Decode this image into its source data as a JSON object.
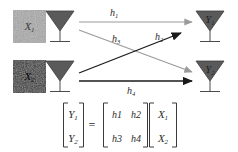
{
  "figure": {
    "colors": {
      "gray_arrow": "#9a9a9a",
      "black_arrow": "#1a1a1a",
      "antenna_fill": "#5a5a5a",
      "antenna_stroke": "#3c3c3c",
      "box_light": "#a8a8a8",
      "box_dark": "#2b2b2b",
      "text": "#2b2b2b",
      "background": "#ffffff"
    }
  },
  "transmitters": [
    {
      "id": "tx1",
      "source_box_label": "X",
      "source_box_sub": "1",
      "box_shade": "light",
      "antenna_name": "tx1-antenna"
    },
    {
      "id": "tx2",
      "source_box_label": "X",
      "source_box_sub": "2",
      "box_shade": "dark",
      "antenna_name": "tx2-antenna"
    }
  ],
  "receivers": [
    {
      "id": "rx1",
      "antenna_label": "Y",
      "antenna_sub": "1"
    },
    {
      "id": "rx2",
      "antenna_label": "Y",
      "antenna_sub": "2"
    }
  ],
  "channels": [
    {
      "id": "h1",
      "label": "h",
      "sub": "1",
      "from": "tx1",
      "to": "rx1",
      "style": "gray",
      "path": "horizontal-top"
    },
    {
      "id": "h3",
      "label": "h",
      "sub": "3",
      "from": "tx1",
      "to": "rx2",
      "style": "gray",
      "path": "diagonal-down"
    },
    {
      "id": "h2",
      "label": "h",
      "sub": "2",
      "from": "tx2",
      "to": "rx1",
      "style": "black",
      "path": "diagonal-up"
    },
    {
      "id": "h4",
      "label": "h",
      "sub": "4",
      "from": "tx2",
      "to": "rx2",
      "style": "black",
      "path": "horizontal-bottom"
    }
  ],
  "equation": {
    "lhs": {
      "rows": [
        {
          "base": "Y",
          "sub": "1"
        },
        {
          "base": "Y",
          "sub": "2"
        }
      ]
    },
    "operator": "=",
    "matrix": {
      "rows": [
        [
          {
            "base": "h",
            "num": "1"
          },
          {
            "base": "h",
            "num": "2"
          }
        ],
        [
          {
            "base": "h",
            "num": "3"
          },
          {
            "base": "h",
            "num": "4"
          }
        ]
      ]
    },
    "rhs": {
      "rows": [
        {
          "base": "X",
          "sub": "1"
        },
        {
          "base": "X",
          "sub": "2"
        }
      ]
    }
  }
}
